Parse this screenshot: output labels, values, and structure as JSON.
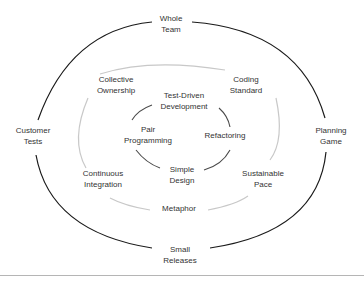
{
  "diagram": {
    "colors": {
      "outer_ring": "#1a1a1a",
      "middle_ring": "#c8c8c8",
      "inner_ring": "#4a4a4a",
      "text": "#333333",
      "rule": "#b5b5b5"
    },
    "outer": {
      "top": [
        "Whole",
        "Team"
      ],
      "left": [
        "Customer",
        "Tests"
      ],
      "right": [
        "Planning",
        "Game"
      ],
      "bottom": [
        "Small",
        "Releases"
      ]
    },
    "middle": {
      "top_left": [
        "Collective",
        "Ownership"
      ],
      "top_right": [
        "Coding",
        "Standard"
      ],
      "bottom_left": [
        "Continuous",
        "Integration"
      ],
      "bottom_right": [
        "Sustainable",
        "Pace"
      ],
      "bottom": [
        "Metaphor"
      ]
    },
    "inner": {
      "top": [
        "Test-Driven",
        "Development"
      ],
      "left": [
        "Pair",
        "Programming"
      ],
      "right": [
        "Refactoring"
      ],
      "bottom": [
        "Simple",
        "Design"
      ]
    }
  }
}
